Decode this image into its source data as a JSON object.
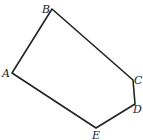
{
  "diagram": {
    "type": "pentagon",
    "vertices": [
      {
        "name": "A",
        "x": 12,
        "y": 73,
        "lx": 2,
        "ly": 77
      },
      {
        "name": "B",
        "x": 52,
        "y": 9,
        "lx": 42,
        "ly": 13
      },
      {
        "name": "C",
        "x": 133,
        "y": 80,
        "lx": 135,
        "ly": 84
      },
      {
        "name": "D",
        "x": 135,
        "y": 104,
        "lx": 133,
        "ly": 113
      },
      {
        "name": "E",
        "x": 96,
        "y": 128,
        "lx": 92,
        "ly": 139
      }
    ],
    "labels": {
      "A": "A",
      "B": "B",
      "C": "C",
      "D": "D",
      "E": "E"
    },
    "stroke": "#222222"
  }
}
